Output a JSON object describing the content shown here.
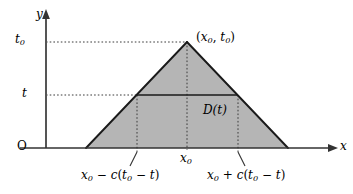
{
  "figure": {
    "axes": {
      "y_label": "y",
      "x_label": "x",
      "origin_label": "O"
    },
    "ticks": {
      "y_upper": {
        "base": "t",
        "sub": "0"
      },
      "y_lower": {
        "base": "t",
        "sub": ""
      },
      "x_center": {
        "base": "x",
        "sub": "0"
      }
    },
    "annotations": {
      "apex_point": {
        "open": "(",
        "x_base": "x",
        "x_sub": "0",
        "comma": ", ",
        "t_base": "t",
        "t_sub": "0",
        "close": ")"
      },
      "interval_label": "D(t)",
      "left_endpoint": {
        "x_base": "x",
        "x_sub": "0",
        "op": " − ",
        "c": "c",
        "open": "(",
        "t0_base": "t",
        "t0_sub": "0",
        "minus": " − ",
        "t": "t",
        "close": ")"
      },
      "right_endpoint": {
        "x_base": "x",
        "x_sub": "0",
        "op": " + ",
        "c": "c",
        "open": "(",
        "t0_base": "t",
        "t0_sub": "0",
        "minus": " − ",
        "t": "t",
        "close": ")"
      }
    },
    "colors": {
      "triangle_fill": "#b5b5b5",
      "stroke": "#1a1a1a",
      "dotted": "#3a3a3a",
      "background": "#ffffff"
    },
    "geometry": {
      "apex": [
        187,
        42
      ],
      "base_left": [
        86,
        148
      ],
      "base_right": [
        288,
        148
      ],
      "chord_left": [
        137,
        95
      ],
      "chord_right": [
        238,
        95
      ],
      "y_axis_x": 46,
      "x_axis_y": 148
    }
  }
}
